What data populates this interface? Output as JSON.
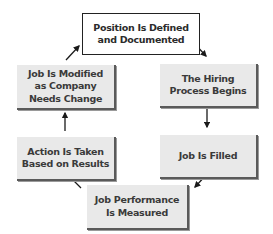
{
  "diagram": {
    "type": "cycle",
    "nodes": [
      {
        "id": "defined",
        "label": "Position Is Defined\nand Documented",
        "lines": [
          "Position Is Defined",
          "and Documented"
        ],
        "style": "white"
      },
      {
        "id": "hiring",
        "label": "The Hiring Process Begins",
        "lines": [
          "The Hiring",
          "Process Begins"
        ],
        "style": "gray"
      },
      {
        "id": "filled",
        "label": "Job Is Filled",
        "lines": [
          "Job Is Filled"
        ],
        "style": "gray"
      },
      {
        "id": "measured",
        "label": "Job Performance Is Measured",
        "lines": [
          "Job Performance",
          "Is Measured"
        ],
        "style": "gray"
      },
      {
        "id": "action",
        "label": "Action Is Taken Based on Results",
        "lines": [
          "Action Is Taken",
          "Based on Results"
        ],
        "style": "gray"
      },
      {
        "id": "modified",
        "label": "Job Is Modified as Company Needs Change",
        "lines": [
          "Job Is Modified",
          "as Company",
          "Needs Change"
        ],
        "style": "gray"
      }
    ],
    "edges": [
      {
        "from": "defined",
        "to": "hiring"
      },
      {
        "from": "hiring",
        "to": "filled"
      },
      {
        "from": "filled",
        "to": "measured"
      },
      {
        "from": "measured",
        "to": "action"
      },
      {
        "from": "action",
        "to": "modified"
      },
      {
        "from": "modified",
        "to": "defined"
      }
    ],
    "colors": {
      "box_fill": "#e9e9e9",
      "top_box_fill": "#ffffff",
      "border": "#222222",
      "text": "#3a3a3a",
      "arrow": "#1a1a1a"
    }
  }
}
